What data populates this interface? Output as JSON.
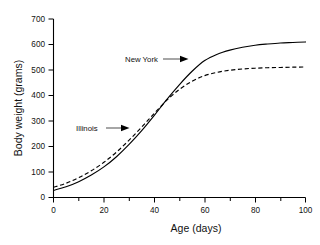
{
  "chart_data": {
    "type": "line",
    "title": "",
    "xlabel": "Age (days)",
    "ylabel": "Body weight (grams)",
    "xlim": [
      0,
      100
    ],
    "ylim": [
      0,
      700
    ],
    "xticks": [
      0,
      20,
      40,
      60,
      80,
      100
    ],
    "yticks": [
      0,
      100,
      200,
      300,
      400,
      500,
      600,
      700
    ],
    "grid": false,
    "legend_position": "inline-annotations",
    "x": [
      0,
      5,
      10,
      15,
      20,
      25,
      30,
      35,
      40,
      45,
      50,
      55,
      60,
      65,
      70,
      75,
      80,
      85,
      90,
      95,
      100
    ],
    "series": [
      {
        "name": "New York",
        "style": "solid",
        "color": "#000000",
        "values": [
          28,
          42,
          62,
          88,
          120,
          160,
          208,
          262,
          322,
          385,
          443,
          495,
          537,
          562,
          578,
          589,
          597,
          602,
          606,
          608,
          610
        ]
      },
      {
        "name": "Illinois",
        "style": "dashed",
        "color": "#000000",
        "values": [
          40,
          56,
          78,
          105,
          138,
          178,
          225,
          276,
          330,
          382,
          424,
          456,
          478,
          491,
          499,
          504,
          507,
          509,
          510,
          511,
          512
        ]
      }
    ],
    "annotations": [
      {
        "text": "New York",
        "series": "New York",
        "arrow": "right",
        "x_at": 56,
        "y_at": 512
      },
      {
        "text": "Illinois",
        "series": "Illinois",
        "arrow": "right",
        "x_at": 34,
        "y_at": 288
      }
    ]
  },
  "axis": {
    "x_tick_labels": [
      "0",
      "20",
      "40",
      "60",
      "80",
      "100"
    ],
    "y_tick_labels": [
      "0",
      "100",
      "200",
      "300",
      "400",
      "500",
      "600",
      "700"
    ],
    "x_title": "Age (days)",
    "y_title": "Body weight (grams)"
  },
  "annotation_labels": {
    "new_york": "New York",
    "illinois": "Illinois"
  }
}
